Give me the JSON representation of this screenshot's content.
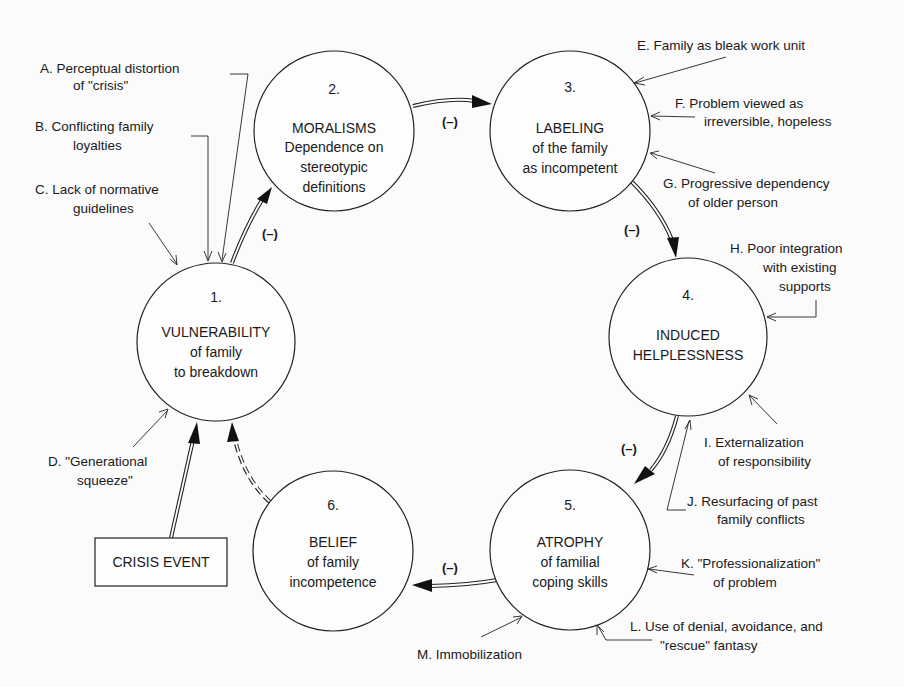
{
  "nodes": [
    {
      "id": 1,
      "num": "1.",
      "title": "VULNERABILITY",
      "lines": [
        "of  family",
        "to breakdown"
      ]
    },
    {
      "id": 2,
      "num": "2.",
      "title": "MORALISMS",
      "lines": [
        "Dependence on",
        "stereotypic",
        "definitions"
      ]
    },
    {
      "id": 3,
      "num": "3.",
      "title": "LABELING",
      "lines": [
        "of the family",
        "as incompetent"
      ]
    },
    {
      "id": 4,
      "num": "4.",
      "title": "INDUCED",
      "lines": [
        "HELPLESSNESS"
      ]
    },
    {
      "id": 5,
      "num": "5.",
      "title": "ATROPHY",
      "lines": [
        "of familial",
        "coping skills"
      ]
    },
    {
      "id": 6,
      "num": "6.",
      "title": "BELIEF",
      "lines": [
        "of family",
        "incompetence"
      ]
    }
  ],
  "crisis_event": "CRISIS EVENT",
  "edge_label": "(–)",
  "factors": {
    "A": [
      "A.  Perceptual distortion",
      "of \"crisis\""
    ],
    "B": [
      "B.  Conflicting family",
      "loyalties"
    ],
    "C": [
      "C.  Lack of normative",
      "guidelines"
    ],
    "D": [
      "D.  \"Generational",
      "squeeze\""
    ],
    "E": [
      "E.  Family as bleak work unit"
    ],
    "F": [
      "F.  Problem viewed as",
      "irreversible, hopeless"
    ],
    "G": [
      "G.  Progressive dependency",
      "of older person"
    ],
    "H": [
      "H. Poor integration",
      "with existing",
      "supports"
    ],
    "I": [
      "I. Externalization",
      "of responsibility"
    ],
    "J": [
      "J.  Resurfacing of past",
      "family conflicts"
    ],
    "K": [
      "K.  \"Professionalization\"",
      "of problem"
    ],
    "L": [
      "L. Use of denial, avoidance, and",
      "\"rescue\" fantasy"
    ],
    "M": [
      "M. Immobilization"
    ]
  }
}
